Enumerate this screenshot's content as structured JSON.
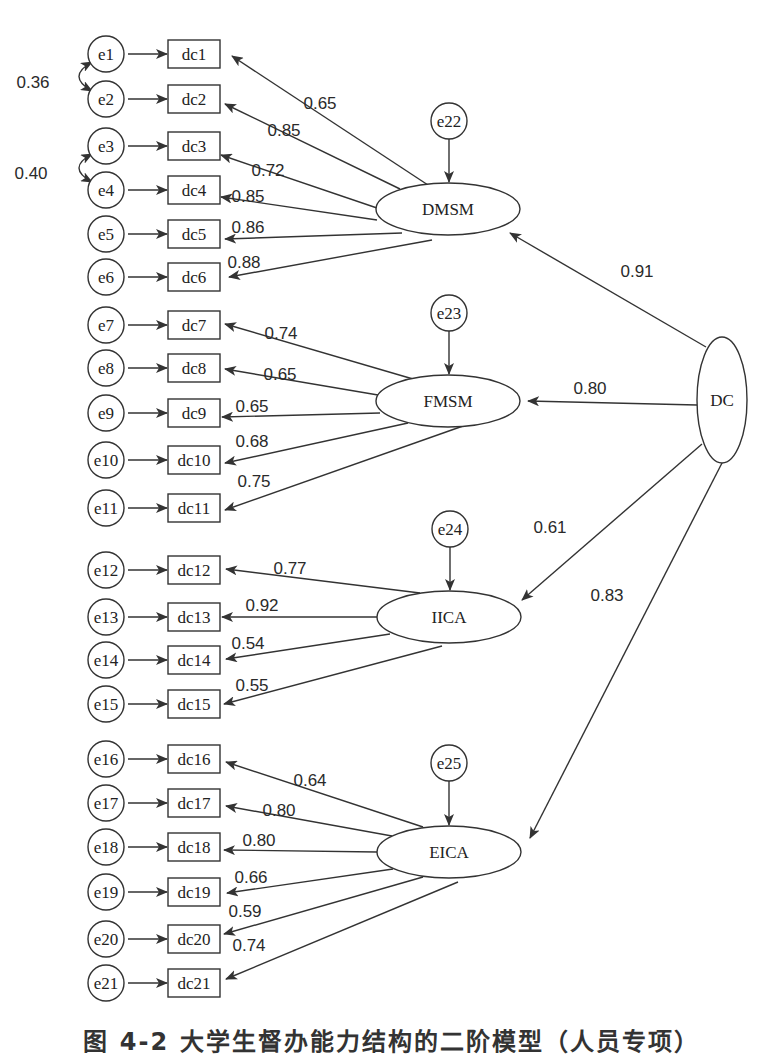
{
  "figure": {
    "caption": "图 4-2  大学生督办能力结构的二阶模型（人员专项）",
    "stroke_color": "#333333",
    "background": "#ffffff"
  },
  "second_order": {
    "id": "DC",
    "label": "DC",
    "cx": 722,
    "cy": 400,
    "rx": 25,
    "ry": 63
  },
  "factors": [
    {
      "id": "DMSM",
      "label": "DMSM",
      "cx": 448,
      "cy": 209,
      "rx": 72,
      "ry": 26,
      "error": {
        "label": "e22",
        "cx": 449,
        "cy": 121
      },
      "loading_from_dc": {
        "value": "0.91",
        "start": [
          706,
          347
        ],
        "end": [
          510,
          233
        ],
        "label_pos": [
          637,
          271
        ]
      }
    },
    {
      "id": "FMSM",
      "label": "FMSM",
      "cx": 448,
      "cy": 401,
      "rx": 72,
      "ry": 26,
      "error": {
        "label": "e23",
        "cx": 449,
        "cy": 313
      },
      "loading_from_dc": {
        "value": "0.80",
        "start": [
          697,
          405
        ],
        "end": [
          528,
          401
        ],
        "label_pos": [
          590,
          388
        ]
      }
    },
    {
      "id": "IICA",
      "label": "IICA",
      "cx": 449,
      "cy": 617,
      "rx": 72,
      "ry": 26,
      "error": {
        "label": "e24",
        "cx": 450,
        "cy": 529
      },
      "loading_from_dc": {
        "value": "0.61",
        "start": [
          702,
          444
        ],
        "end": [
          522,
          600
        ],
        "label_pos": [
          550,
          527
        ]
      }
    },
    {
      "id": "EICA",
      "label": "EICA",
      "cx": 449,
      "cy": 852,
      "rx": 72,
      "ry": 26,
      "error": {
        "label": "e25",
        "cx": 449,
        "cy": 763
      },
      "loading_from_dc": {
        "value": "0.83",
        "start": [
          722,
          463
        ],
        "end": [
          530,
          838
        ],
        "label_pos": [
          607,
          595
        ]
      }
    }
  ],
  "indicators": [
    {
      "label": "dc1",
      "error": "e1",
      "y": 54,
      "factor": "DMSM",
      "loading": "0.65",
      "start": [
        428,
        185
      ],
      "end": [
        232,
        56
      ],
      "label_pos": [
        320,
        103
      ]
    },
    {
      "label": "dc2",
      "error": "e2",
      "y": 99,
      "factor": "DMSM",
      "loading": "0.85",
      "start": [
        400,
        189
      ],
      "end": [
        225,
        104
      ],
      "label_pos": [
        284,
        130
      ]
    },
    {
      "label": "dc3",
      "error": "e3",
      "y": 146,
      "factor": "DMSM",
      "loading": "0.72",
      "start": [
        377,
        208
      ],
      "end": [
        221,
        155
      ],
      "label_pos": [
        268,
        170
      ]
    },
    {
      "label": "dc4",
      "error": "e4",
      "y": 190,
      "factor": "DMSM",
      "loading": "0.85",
      "start": [
        377,
        220
      ],
      "end": [
        221,
        197
      ],
      "label_pos": [
        248,
        196
      ]
    },
    {
      "label": "dc5",
      "error": "e5",
      "y": 234,
      "factor": "DMSM",
      "loading": "0.86",
      "start": [
        402,
        233
      ],
      "end": [
        225,
        239
      ],
      "label_pos": [
        248,
        227
      ]
    },
    {
      "label": "dc6",
      "error": "e6",
      "y": 277,
      "factor": "DMSM",
      "loading": "0.88",
      "start": [
        432,
        240
      ],
      "end": [
        229,
        277
      ],
      "label_pos": [
        244,
        262
      ]
    },
    {
      "label": "dc7",
      "error": "e7",
      "y": 325,
      "factor": "FMSM",
      "loading": "0.74",
      "start": [
        413,
        379
      ],
      "end": [
        225,
        324
      ],
      "label_pos": [
        281,
        333
      ]
    },
    {
      "label": "dc8",
      "error": "e8",
      "y": 368,
      "factor": "FMSM",
      "loading": "0.65",
      "start": [
        378,
        395
      ],
      "end": [
        225,
        369
      ],
      "label_pos": [
        280,
        374
      ]
    },
    {
      "label": "dc9",
      "error": "e9",
      "y": 413,
      "factor": "FMSM",
      "loading": "0.65",
      "start": [
        380,
        413
      ],
      "end": [
        222,
        417
      ],
      "label_pos": [
        252,
        406
      ]
    },
    {
      "label": "dc10",
      "error": "e10",
      "y": 460,
      "factor": "FMSM",
      "loading": "0.68",
      "start": [
        408,
        423
      ],
      "end": [
        225,
        463
      ],
      "label_pos": [
        252,
        441
      ]
    },
    {
      "label": "dc11",
      "error": "e11",
      "y": 508,
      "factor": "FMSM",
      "loading": "0.75",
      "start": [
        463,
        426
      ],
      "end": [
        225,
        510
      ],
      "label_pos": [
        254,
        481
      ]
    },
    {
      "label": "dc12",
      "error": "e12",
      "y": 570,
      "factor": "IICA",
      "loading": "0.77",
      "start": [
        420,
        593
      ],
      "end": [
        226,
        569
      ],
      "label_pos": [
        290,
        568
      ]
    },
    {
      "label": "dc13",
      "error": "e13",
      "y": 617,
      "factor": "IICA",
      "loading": "0.92",
      "start": [
        377,
        617
      ],
      "end": [
        222,
        617
      ],
      "label_pos": [
        262,
        605
      ]
    },
    {
      "label": "dc14",
      "error": "e14",
      "y": 660,
      "factor": "IICA",
      "loading": "0.54",
      "start": [
        390,
        634
      ],
      "end": [
        226,
        659
      ],
      "label_pos": [
        248,
        643
      ]
    },
    {
      "label": "dc15",
      "error": "e15",
      "y": 704,
      "factor": "IICA",
      "loading": "0.55",
      "start": [
        442,
        646
      ],
      "end": [
        224,
        704
      ],
      "label_pos": [
        252,
        685
      ]
    },
    {
      "label": "dc16",
      "error": "e16",
      "y": 759,
      "factor": "EICA",
      "loading": "0.64",
      "start": [
        423,
        827
      ],
      "end": [
        226,
        762
      ],
      "label_pos": [
        310,
        780
      ]
    },
    {
      "label": "dc17",
      "error": "e17",
      "y": 803,
      "factor": "EICA",
      "loading": "0.80",
      "start": [
        392,
        836
      ],
      "end": [
        226,
        806
      ],
      "label_pos": [
        279,
        810
      ]
    },
    {
      "label": "dc18",
      "error": "e18",
      "y": 847,
      "factor": "EICA",
      "loading": "0.80",
      "start": [
        377,
        852
      ],
      "end": [
        224,
        850
      ],
      "label_pos": [
        259,
        840
      ]
    },
    {
      "label": "dc19",
      "error": "e19",
      "y": 892,
      "factor": "EICA",
      "loading": "0.66",
      "start": [
        393,
        869
      ],
      "end": [
        227,
        893
      ],
      "label_pos": [
        251,
        877
      ]
    },
    {
      "label": "dc20",
      "error": "e20",
      "y": 939,
      "factor": "EICA",
      "loading": "0.59",
      "start": [
        423,
        877
      ],
      "end": [
        224,
        934
      ],
      "label_pos": [
        245,
        911
      ]
    },
    {
      "label": "dc21",
      "error": "e21",
      "y": 983,
      "factor": "EICA",
      "loading": "0.74",
      "start": [
        458,
        882
      ],
      "end": [
        226,
        979
      ],
      "label_pos": [
        249,
        945
      ]
    }
  ],
  "covariances": [
    {
      "between": [
        "e1",
        "e2"
      ],
      "value": "0.36",
      "label_pos": [
        33,
        82
      ]
    },
    {
      "between": [
        "e3",
        "e4"
      ],
      "value": "0.40",
      "label_pos": [
        31,
        173
      ]
    }
  ]
}
